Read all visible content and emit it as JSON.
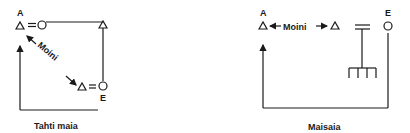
{
  "diagrams": [
    {
      "caption": "Tahti maia",
      "node_top_label": "A",
      "node_bottom_label": "E",
      "relation_label": "Moini"
    },
    {
      "caption": "Maisaia",
      "node_left_label": "A",
      "node_right_label": "E",
      "relation_label": "Moini"
    }
  ],
  "colors": {
    "ink": "#1a1a1a",
    "background": "#ffffff"
  }
}
